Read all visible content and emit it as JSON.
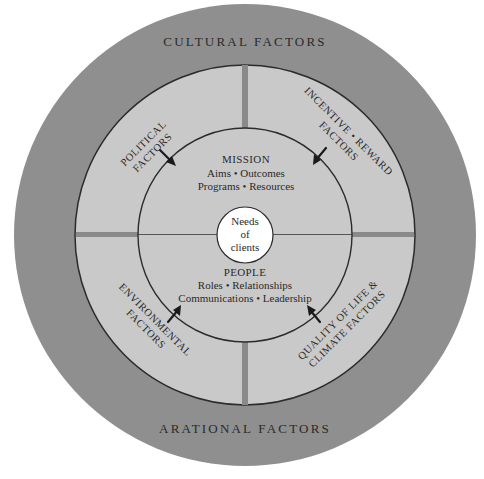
{
  "diagram": {
    "outer_ring": {
      "top_label": "CULTURAL FACTORS",
      "bottom_label": "ARATIONAL FACTORS"
    },
    "quadrants": [
      {
        "position": "top-left",
        "lines": [
          "POLITICAL",
          "FACTORS"
        ]
      },
      {
        "position": "top-right",
        "lines": [
          "INCENTIVE • REWARD",
          "FACTORS"
        ]
      },
      {
        "position": "bottom-left",
        "lines": [
          "ENVIRONMENTAL",
          "FACTORS"
        ]
      },
      {
        "position": "bottom-right",
        "lines": [
          "QUALITY OF LIFE &",
          "CLIMATE FACTORS"
        ]
      }
    ],
    "mission": {
      "title": "MISSION",
      "line1": "Aims • Outcomes",
      "line2": "Programs • Resources"
    },
    "people": {
      "title": "PEOPLE",
      "line1": "Roles • Relationships",
      "line2": "Communications • Leadership"
    },
    "center": {
      "lines": [
        "Needs",
        "of",
        "clients"
      ]
    },
    "colors": {
      "outer_ring": "#8f8f8f",
      "inner_field": "#c9c9c9",
      "center_circle": "#ffffff",
      "lines": "#2b2b2b",
      "divider_bar": "#8a8a8a"
    }
  }
}
